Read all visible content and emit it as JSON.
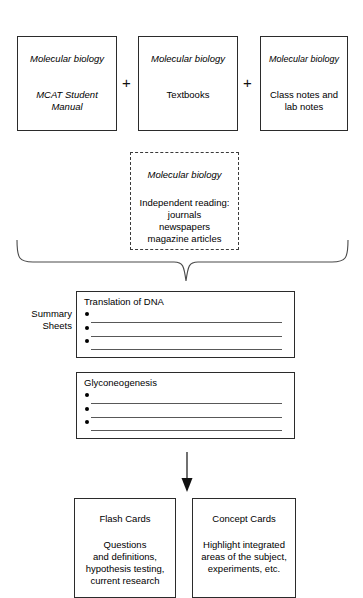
{
  "diagram": {
    "sources": [
      {
        "subject": "Molecular biology",
        "detail": "MCAT Student\nManual",
        "detail_italic": true
      },
      {
        "subject": "Molecular biology",
        "detail": "Textbooks",
        "detail_italic": false
      },
      {
        "subject": "Molecular biology",
        "detail": "Class notes and\nlab notes",
        "detail_italic": false
      }
    ],
    "operators": [
      "+",
      "+"
    ],
    "optional_source": {
      "subject": "Molecular biology",
      "detail": "Independent reading:\njournals\nnewspapers\nmagazine articles"
    },
    "summary_label": "Summary\nSheets",
    "summary_sheets": [
      {
        "title": "Translation of DNA",
        "bullets": [
          "",
          "",
          ""
        ]
      },
      {
        "title": "Glyconeogenesis",
        "bullets": [
          "",
          "",
          ""
        ]
      }
    ],
    "outputs": [
      {
        "title": "Flash Cards",
        "body": "Questions\nand definitions,\nhypothesis testing,\ncurrent research"
      },
      {
        "title": "Concept Cards",
        "body": "Highlight integrated\nareas of the subject,\nexperiments, etc."
      }
    ],
    "colors": {
      "stroke": "#2b2b2b",
      "rule": "#585858",
      "background": "#ffffff",
      "text": "#000000"
    }
  }
}
